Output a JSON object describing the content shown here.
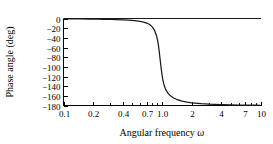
{
  "chart_data": {
    "type": "line",
    "title": "",
    "xlabel": "Angular frequency",
    "xlabel_symbol": "ω",
    "ylabel": "Phase angle (deg)",
    "xscale": "log",
    "yscale": "linear",
    "xlim": [
      0.1,
      10
    ],
    "ylim": [
      -180,
      0
    ],
    "grid": false,
    "legend": null,
    "x_tick_labels": [
      "0.1",
      "0.2",
      "0.4",
      "0.7",
      "1.0",
      "2",
      "4",
      "7",
      "10"
    ],
    "x_tick_values": [
      0.1,
      0.2,
      0.4,
      0.7,
      1.0,
      2,
      4,
      7,
      10
    ],
    "x_minor_ticks": [
      0.3,
      0.5,
      0.6,
      0.8,
      0.9,
      3,
      5,
      6,
      8,
      9
    ],
    "y_tick_labels": [
      "0",
      "−20",
      "−40",
      "−60",
      "−80",
      "−100",
      "−120",
      "−140",
      "−160",
      "−180"
    ],
    "y_tick_values": [
      0,
      -20,
      -40,
      -60,
      -80,
      -100,
      -120,
      -140,
      -160,
      -180
    ],
    "series": [
      {
        "name": "phase",
        "x": [
          0.1,
          0.12,
          0.15,
          0.18,
          0.22,
          0.26,
          0.3,
          0.35,
          0.4,
          0.45,
          0.5,
          0.55,
          0.6,
          0.65,
          0.7,
          0.75,
          0.8,
          0.84,
          0.88,
          0.9,
          0.92,
          0.94,
          0.96,
          0.98,
          1.0,
          1.02,
          1.04,
          1.06,
          1.08,
          1.1,
          1.15,
          1.2,
          1.3,
          1.4,
          1.6,
          1.8,
          2.0,
          2.5,
          3.0,
          4.0,
          5.0,
          6.0,
          7.0,
          8.0,
          9.0,
          10.0
        ],
        "y": [
          -0.6,
          -0.7,
          -0.9,
          -1.1,
          -1.4,
          -1.7,
          -2.0,
          -2.4,
          -2.9,
          -3.4,
          -4.0,
          -4.8,
          -5.9,
          -7.3,
          -9.4,
          -12.5,
          -17.8,
          -24.4,
          -35.6,
          -44.2,
          -55.6,
          -70.3,
          -86.8,
          -102.6,
          -116.0,
          -126.5,
          -134.4,
          -140.3,
          -144.8,
          -148.3,
          -154.6,
          -158.7,
          -164.0,
          -167.2,
          -171.0,
          -173.1,
          -174.4,
          -176.3,
          -177.3,
          -178.2,
          -178.7,
          -179.0,
          -179.2,
          -179.3,
          -179.4,
          -179.5
        ]
      }
    ]
  },
  "figure": {
    "background_color": "#ffffff",
    "line_color": "#1a1a1a",
    "axis_color": "#000000"
  }
}
